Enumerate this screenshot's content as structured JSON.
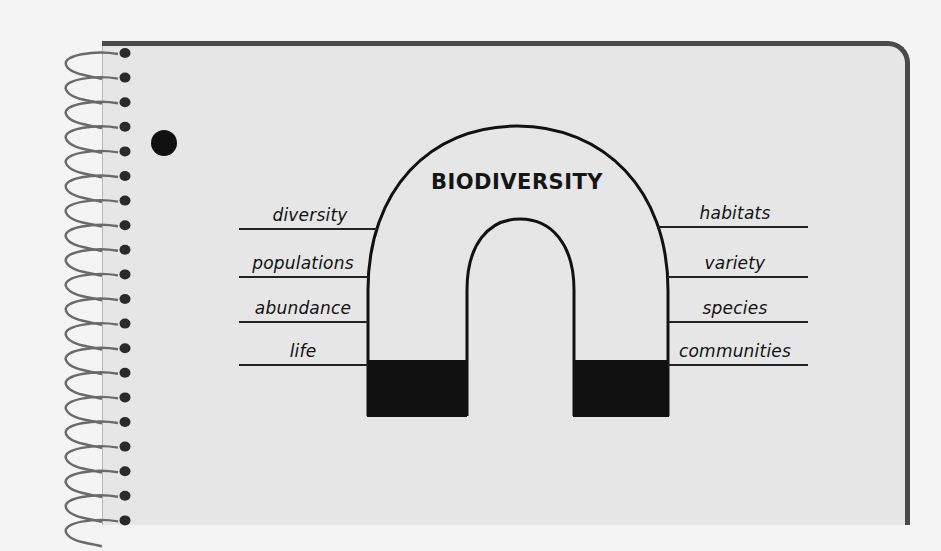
{
  "diagram": {
    "title": "BIODIVERSITY",
    "shape": "horseshoe-magnet",
    "left_labels": [
      {
        "text": "diversity",
        "line_y": 229
      },
      {
        "text": "populations",
        "line_y": 277
      },
      {
        "text": "abundance",
        "line_y": 322
      },
      {
        "text": "life",
        "line_y": 365
      }
    ],
    "right_labels": [
      {
        "text": "habitats",
        "line_y": 229
      },
      {
        "text": "variety",
        "line_y": 277
      },
      {
        "text": "species",
        "line_y": 322
      },
      {
        "text": "communities",
        "line_y": 365
      }
    ]
  },
  "notebook": {
    "spiral_rings": 20,
    "punch_holes": 1
  },
  "colors": {
    "page": "#e6e6e6",
    "border": "#4a4a4a",
    "ink": "#111111",
    "background": "#f4f4f4"
  }
}
